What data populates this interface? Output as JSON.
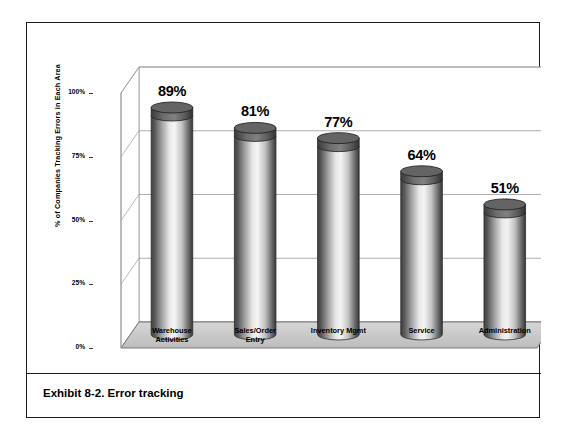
{
  "exhibit": {
    "caption": "Exhibit 8-2. Error tracking"
  },
  "chart_data": {
    "type": "bar",
    "title": "",
    "subtitle": "",
    "xlabel": "",
    "ylabel": "% of Companies Tracking Errors in Each Area",
    "ylim": [
      0,
      100
    ],
    "yticks": [
      "0%",
      "25%",
      "50%",
      "75%",
      "100%"
    ],
    "ytick_values": [
      0,
      25,
      50,
      75,
      100
    ],
    "grid": true,
    "legend": "none",
    "style": "3d-cylinder",
    "categories": [
      "Warehouse Activities",
      "Sales/Order Entry",
      "Inventory Mgmt",
      "Service",
      "Administration"
    ],
    "category_lines": [
      [
        "Warehouse",
        "Activities"
      ],
      [
        "Sales/Order",
        "Entry"
      ],
      [
        "Inventory Mgmt",
        ""
      ],
      [
        "Service",
        ""
      ],
      [
        "Administration",
        ""
      ]
    ],
    "values": [
      89,
      81,
      77,
      64,
      51
    ],
    "data_labels": [
      "89%",
      "81%",
      "77%",
      "64%",
      "51%"
    ]
  },
  "colors": {
    "frame": "#1a1a1a",
    "gridline": "#999999",
    "floor": "#c9c9c9",
    "floor_edge": "#6e6e6e",
    "bar_dark": "#4a4a4a",
    "bar_light": "#f2f2f2",
    "bar_cap": "#5a5a5a",
    "text": "#000000"
  }
}
